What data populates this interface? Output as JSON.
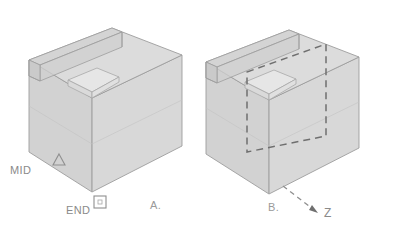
{
  "figure": {
    "background_color": "#ffffff",
    "panels": [
      {
        "id": "panel-a",
        "label": "A.",
        "label_x": 150,
        "label_y": 209,
        "markers": [
          {
            "id": "mid-marker",
            "shape": "triangle",
            "label": "MID",
            "label_x": 10,
            "label_y": 174,
            "marker_x": 59,
            "marker_y": 161
          },
          {
            "id": "end-marker",
            "shape": "square",
            "label": "END",
            "label_x": 66,
            "label_y": 214,
            "marker_x": 100,
            "marker_y": 203
          }
        ]
      },
      {
        "id": "panel-b",
        "label": "B.",
        "label_x": 268,
        "label_y": 211,
        "axis": {
          "id": "z-axis",
          "label": "Z",
          "label_x": 324,
          "label_y": 217,
          "arrow_from_x": 283,
          "arrow_from_y": 186,
          "arrow_to_x": 316,
          "arrow_to_y": 211
        },
        "section_plane": {
          "id": "section-plane",
          "style": "dashed"
        }
      }
    ],
    "colors": {
      "face_top": "#dcdcdc",
      "face_left": "#d2d2d2",
      "face_right": "#d8d8d8",
      "face_notch": "#e4e4e4",
      "face_channel": "#cfcfcf",
      "edge": "#9d9d9d",
      "edge_light": "#b4b4b4",
      "dashed_line": "#6f6f6f",
      "label_text": "#8a8a8a",
      "marker_stroke": "#8f8f8f"
    },
    "geometry_note": {
      "projection": "isometric",
      "description": "Rectangular block with a recessed channel along the upper-left top edge and a stepped notch at the top face center"
    }
  }
}
